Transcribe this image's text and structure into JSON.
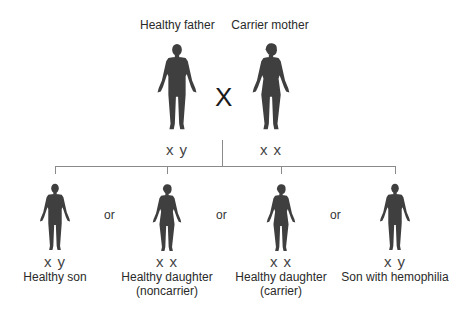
{
  "parents": {
    "father": {
      "label": "Healthy father",
      "genotype": "x y",
      "sex": "male"
    },
    "mother": {
      "label": "Carrier mother",
      "genotype": "x x",
      "sex": "female"
    },
    "cross_symbol": "X"
  },
  "offspring": [
    {
      "label": "Healthy son",
      "sublabel": "",
      "genotype": "x y",
      "sex": "male"
    },
    {
      "label": "Healthy daughter",
      "sublabel": "(noncarrier)",
      "genotype": "x x",
      "sex": "female"
    },
    {
      "label": "Healthy daughter",
      "sublabel": "(carrier)",
      "genotype": "x x",
      "sex": "female"
    },
    {
      "label": "Son with hemophilia",
      "sublabel": "",
      "genotype": "x y",
      "sex": "male"
    }
  ],
  "separator": "or",
  "colors": {
    "figure": "#3f3f3f",
    "line": "#8a8a8a"
  }
}
